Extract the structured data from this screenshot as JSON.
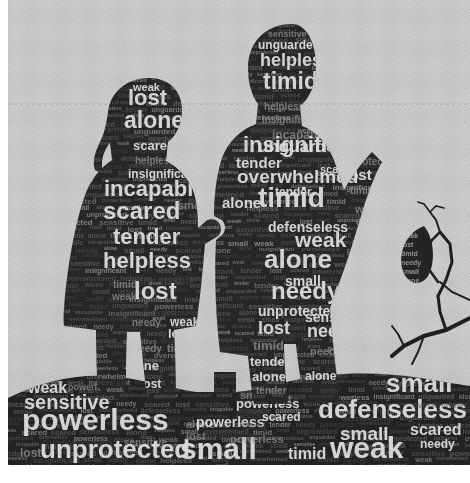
{
  "artwork": {
    "title": "Word cloud silhouette of two children holding hands",
    "medium": "word-cloud typographic artwork",
    "canvas": {
      "width": 470,
      "height": 483
    },
    "colors": {
      "background": "#c7c8c6",
      "background_lower": "#bfc0be",
      "paper_margin": "#ffffff",
      "silhouette_dark": "#272727",
      "silhouette_ground": "#232323",
      "word_light": "#d9dad7",
      "word_mid": "#8e8f8c",
      "word_dim": "#4a4a49",
      "horizon_line": "#b0b1af"
    },
    "margins": {
      "left": 8,
      "top": 0,
      "right": 0,
      "bottom": 18
    },
    "horizon": {
      "y": 104,
      "style": "faint dashed line"
    }
  },
  "figures": [
    {
      "name": "girl-silhouette",
      "description": "Standing girl with long hair in a dress, left figure, holding hands with the boy",
      "bounds": {
        "x": 62,
        "y": 78,
        "width": 160,
        "height": 330
      }
    },
    {
      "name": "boy-silhouette",
      "description": "Standing boy with short hair, right figure, one arm extended outward",
      "bounds": {
        "x": 222,
        "y": 24,
        "width": 180,
        "height": 380
      }
    },
    {
      "name": "ground-silhouette",
      "description": "Dark textured ground / hill filling the lower band of the image",
      "bounds": {
        "x": 8,
        "y": 372,
        "width": 462,
        "height": 93
      }
    },
    {
      "name": "branch-silhouette",
      "description": "Bare twig with a leaf at the right edge",
      "bounds": {
        "x": 400,
        "y": 225,
        "width": 70,
        "height": 150
      }
    }
  ],
  "vocabulary": [
    "weak",
    "lost",
    "alone",
    "scared",
    "helpless",
    "insignificant",
    "incapable",
    "tender",
    "timid",
    "needy",
    "small",
    "sensitive",
    "unguarded",
    "unprotected",
    "overwhelmed",
    "defenseless",
    "powerless"
  ],
  "word_cloud": {
    "girl": [
      {
        "text": "weak",
        "x": 133,
        "y": 91,
        "size": 11,
        "tone": "light"
      },
      {
        "text": "lost",
        "x": 128,
        "y": 105,
        "size": 22,
        "tone": "light"
      },
      {
        "text": "alone",
        "x": 124,
        "y": 128,
        "size": 23,
        "tone": "light"
      },
      {
        "text": "scared",
        "x": 133,
        "y": 150,
        "size": 13,
        "tone": "light"
      },
      {
        "text": "helpless",
        "x": 135,
        "y": 164,
        "size": 10,
        "tone": "mid"
      },
      {
        "text": "insignificant",
        "x": 128,
        "y": 178,
        "size": 12,
        "tone": "light"
      },
      {
        "text": "incapable",
        "x": 104,
        "y": 196,
        "size": 22,
        "tone": "light"
      },
      {
        "text": "scared",
        "x": 103,
        "y": 219,
        "size": 24,
        "tone": "light"
      },
      {
        "text": "small",
        "x": 178,
        "y": 209,
        "size": 11,
        "tone": "mid"
      },
      {
        "text": "tender",
        "x": 113,
        "y": 244,
        "size": 22,
        "tone": "light"
      },
      {
        "text": "helpless",
        "x": 103,
        "y": 268,
        "size": 22,
        "tone": "light"
      },
      {
        "text": "incapable",
        "x": 140,
        "y": 285,
        "size": 12,
        "tone": "dim"
      },
      {
        "text": "lost",
        "x": 134,
        "y": 299,
        "size": 24,
        "tone": "light"
      },
      {
        "text": "timid",
        "x": 113,
        "y": 288,
        "size": 10,
        "tone": "mid"
      },
      {
        "text": "weak",
        "x": 112,
        "y": 300,
        "size": 10,
        "tone": "mid"
      },
      {
        "text": "overwhelmed",
        "x": 119,
        "y": 316,
        "size": 9,
        "tone": "dim"
      },
      {
        "text": "needy",
        "x": 132,
        "y": 326,
        "size": 10,
        "tone": "mid"
      },
      {
        "text": "weak",
        "x": 170,
        "y": 326,
        "size": 12,
        "tone": "light"
      },
      {
        "text": "lost",
        "x": 168,
        "y": 338,
        "size": 13,
        "tone": "light"
      },
      {
        "text": "timid",
        "x": 167,
        "y": 352,
        "size": 11,
        "tone": "mid"
      },
      {
        "text": "alone",
        "x": 125,
        "y": 370,
        "size": 13,
        "tone": "light"
      },
      {
        "text": "needy",
        "x": 133,
        "y": 352,
        "size": 10,
        "tone": "mid"
      },
      {
        "text": "lost",
        "x": 140,
        "y": 388,
        "size": 12,
        "tone": "light"
      },
      {
        "text": "alone",
        "x": 176,
        "y": 382,
        "size": 12,
        "tone": "light"
      },
      {
        "text": "scared",
        "x": 94,
        "y": 347,
        "size": 9,
        "tone": "dim"
      }
    ],
    "boy": [
      {
        "text": "sensitive",
        "x": 268,
        "y": 37,
        "size": 9,
        "tone": "mid"
      },
      {
        "text": "unguarded",
        "x": 258,
        "y": 49,
        "size": 12,
        "tone": "light"
      },
      {
        "text": "helpless",
        "x": 260,
        "y": 66,
        "size": 18,
        "tone": "light"
      },
      {
        "text": "timid",
        "x": 263,
        "y": 89,
        "size": 23,
        "tone": "light"
      },
      {
        "text": "helpless",
        "x": 264,
        "y": 110,
        "size": 10,
        "tone": "mid"
      },
      {
        "text": "insignificant",
        "x": 262,
        "y": 123,
        "size": 10,
        "tone": "mid"
      },
      {
        "text": "incapable",
        "x": 272,
        "y": 139,
        "size": 12,
        "tone": "mid"
      },
      {
        "text": "unguarded",
        "x": 258,
        "y": 152,
        "size": 17,
        "tone": "light"
      },
      {
        "text": "defenseless",
        "x": 250,
        "y": 133,
        "size": 9,
        "tone": "dim"
      },
      {
        "text": "insignificant",
        "x": 243,
        "y": 152,
        "size": 22,
        "tone": "light"
      },
      {
        "text": "tender",
        "x": 236,
        "y": 168,
        "size": 15,
        "tone": "light"
      },
      {
        "text": "overwhelmed",
        "x": 237,
        "y": 183,
        "size": 19,
        "tone": "light"
      },
      {
        "text": "scared",
        "x": 320,
        "y": 173,
        "size": 11,
        "tone": "light"
      },
      {
        "text": "tender",
        "x": 275,
        "y": 196,
        "size": 12,
        "tone": "light"
      },
      {
        "text": "timid",
        "x": 258,
        "y": 207,
        "size": 28,
        "tone": "light"
      },
      {
        "text": "alone",
        "x": 222,
        "y": 208,
        "size": 15,
        "tone": "light"
      },
      {
        "text": "defenseless",
        "x": 268,
        "y": 232,
        "size": 14,
        "tone": "light"
      },
      {
        "text": "weak",
        "x": 295,
        "y": 247,
        "size": 21,
        "tone": "light"
      },
      {
        "text": "alone",
        "x": 264,
        "y": 268,
        "size": 26,
        "tone": "light"
      },
      {
        "text": "small",
        "x": 285,
        "y": 286,
        "size": 14,
        "tone": "light"
      },
      {
        "text": "needy",
        "x": 271,
        "y": 299,
        "size": 24,
        "tone": "light"
      },
      {
        "text": "unprotected",
        "x": 258,
        "y": 316,
        "size": 14,
        "tone": "light"
      },
      {
        "text": "sensitive",
        "x": 305,
        "y": 322,
        "size": 14,
        "tone": "light"
      },
      {
        "text": "lost",
        "x": 258,
        "y": 334,
        "size": 18,
        "tone": "light"
      },
      {
        "text": "needy",
        "x": 307,
        "y": 337,
        "size": 18,
        "tone": "light"
      },
      {
        "text": "timid",
        "x": 253,
        "y": 350,
        "size": 13,
        "tone": "mid"
      },
      {
        "text": "needy",
        "x": 310,
        "y": 355,
        "size": 11,
        "tone": "mid"
      },
      {
        "text": "tender",
        "x": 250,
        "y": 366,
        "size": 13,
        "tone": "light"
      },
      {
        "text": "alone",
        "x": 252,
        "y": 381,
        "size": 13,
        "tone": "light"
      },
      {
        "text": "alone",
        "x": 305,
        "y": 380,
        "size": 12,
        "tone": "light"
      },
      {
        "text": "tender",
        "x": 256,
        "y": 394,
        "size": 10,
        "tone": "mid"
      },
      {
        "text": "unprotected",
        "x": 340,
        "y": 165,
        "size": 10,
        "tone": "mid"
      },
      {
        "text": "lost",
        "x": 345,
        "y": 180,
        "size": 15,
        "tone": "light"
      },
      {
        "text": "timid",
        "x": 350,
        "y": 194,
        "size": 10,
        "tone": "mid"
      },
      {
        "text": "weak",
        "x": 355,
        "y": 213,
        "size": 11,
        "tone": "mid"
      },
      {
        "text": "alone",
        "x": 356,
        "y": 225,
        "size": 11,
        "tone": "mid"
      },
      {
        "text": "small",
        "x": 358,
        "y": 237,
        "size": 10,
        "tone": "dim"
      },
      {
        "text": "timid",
        "x": 363,
        "y": 262,
        "size": 9,
        "tone": "dim"
      }
    ],
    "ground": [
      {
        "text": "weak",
        "x": 28,
        "y": 393,
        "size": 16,
        "tone": "light"
      },
      {
        "text": "powerless",
        "x": 68,
        "y": 390,
        "size": 9,
        "tone": "mid"
      },
      {
        "text": "sensitive",
        "x": 24,
        "y": 409,
        "size": 20,
        "tone": "light"
      },
      {
        "text": "powerless",
        "x": 22,
        "y": 430,
        "size": 30,
        "tone": "light"
      },
      {
        "text": "overwhelmed",
        "x": 42,
        "y": 446,
        "size": 11,
        "tone": "dim"
      },
      {
        "text": "sensitive",
        "x": 124,
        "y": 446,
        "size": 10,
        "tone": "mid"
      },
      {
        "text": "unprotected",
        "x": 40,
        "y": 458,
        "size": 26,
        "tone": "light"
      },
      {
        "text": "lost",
        "x": 20,
        "y": 457,
        "size": 12,
        "tone": "mid"
      },
      {
        "text": "alone",
        "x": 186,
        "y": 428,
        "size": 11,
        "tone": "mid"
      },
      {
        "text": "lost",
        "x": 186,
        "y": 440,
        "size": 11,
        "tone": "mid"
      },
      {
        "text": "insignificant",
        "x": 204,
        "y": 440,
        "size": 10,
        "tone": "dim"
      },
      {
        "text": "powerless",
        "x": 196,
        "y": 427,
        "size": 14,
        "tone": "light"
      },
      {
        "text": "small",
        "x": 180,
        "y": 459,
        "size": 30,
        "tone": "light"
      },
      {
        "text": "timid",
        "x": 288,
        "y": 459,
        "size": 16,
        "tone": "light"
      },
      {
        "text": "weak",
        "x": 330,
        "y": 458,
        "size": 30,
        "tone": "light"
      },
      {
        "text": "needy",
        "x": 420,
        "y": 448,
        "size": 12,
        "tone": "light"
      },
      {
        "text": "small",
        "x": 386,
        "y": 392,
        "size": 26,
        "tone": "light"
      },
      {
        "text": "defenseless",
        "x": 446,
        "y": 381,
        "size": 9,
        "tone": "mid"
      },
      {
        "text": "defenseless",
        "x": 318,
        "y": 418,
        "size": 26,
        "tone": "light"
      },
      {
        "text": "small",
        "x": 340,
        "y": 440,
        "size": 19,
        "tone": "light"
      },
      {
        "text": "scared",
        "x": 410,
        "y": 435,
        "size": 16,
        "tone": "light"
      },
      {
        "text": "overwhelmed",
        "x": 412,
        "y": 408,
        "size": 9,
        "tone": "dim"
      },
      {
        "text": "powerless",
        "x": 230,
        "y": 443,
        "size": 11,
        "tone": "mid"
      },
      {
        "text": "scared",
        "x": 262,
        "y": 421,
        "size": 12,
        "tone": "light"
      },
      {
        "text": "timid",
        "x": 242,
        "y": 430,
        "size": 10,
        "tone": "dim"
      },
      {
        "text": "powerless",
        "x": 236,
        "y": 408,
        "size": 13,
        "tone": "light"
      },
      {
        "text": "small",
        "x": 240,
        "y": 399,
        "size": 11,
        "tone": "mid"
      },
      {
        "text": "timid",
        "x": 238,
        "y": 389,
        "size": 12,
        "tone": "light"
      },
      {
        "text": "alone",
        "x": 240,
        "y": 377,
        "size": 13,
        "tone": "light"
      },
      {
        "text": "tender",
        "x": 236,
        "y": 372,
        "size": 11,
        "tone": "mid"
      },
      {
        "text": "lost",
        "x": 272,
        "y": 403,
        "size": 11,
        "tone": "mid"
      },
      {
        "text": "needy",
        "x": 236,
        "y": 418,
        "size": 9,
        "tone": "dim"
      }
    ]
  }
}
